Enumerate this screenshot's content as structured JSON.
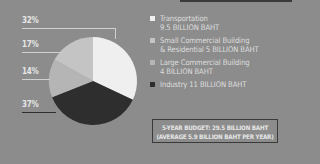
{
  "chart_data": {
    "type": "pie",
    "title": "",
    "slices": [
      {
        "label": "Transportation",
        "value_text": "9.5 BILLION BAHT",
        "value": 9.5,
        "percent": 32,
        "color": "#efefef"
      },
      {
        "label": "Small Commercial Building & Residential",
        "value_text": "5 BILLION BAHT",
        "value": 5,
        "percent": 17,
        "color": "#c4c4c4"
      },
      {
        "label": "Large Commercial Building",
        "value_text": "4 BILLION BAHT",
        "value": 4,
        "percent": 14,
        "color": "#b5b5b5"
      },
      {
        "label": "Industry",
        "value_text": "11 BILLION BAHT",
        "value": 11,
        "percent": 37,
        "color": "#2e2e2e"
      }
    ],
    "legend_position": "right",
    "annotation": "5-YEAR BUDGET: 29.5 BILLION BAHT (AVERAGE 5.9 BILLION BAHT PER YEAR)"
  },
  "labels": {
    "pct": [
      "32%",
      "17%",
      "14%",
      "37%"
    ]
  },
  "legend": {
    "items": [
      {
        "line1": "Transportation",
        "line2": "9.5 BILLION BAHT",
        "color": "#efefef"
      },
      {
        "line1": "Small Commercial Building",
        "line2": "& Residential 5 BILLION BAHT",
        "color": "#c4c4c4"
      },
      {
        "line1": "Large Commercial Building",
        "line2": "4 BILLION BAHT",
        "color": "#b5b5b5"
      },
      {
        "line1": "Industry 11 BILLION BAHT",
        "line2": "",
        "color": "#2e2e2e"
      }
    ]
  },
  "budget": {
    "line1": "5-YEAR BUDGET: 29.5 BILLION BAHT",
    "line2": "(AVERAGE 5.9 BILLION BAHT PER YEAR)"
  }
}
